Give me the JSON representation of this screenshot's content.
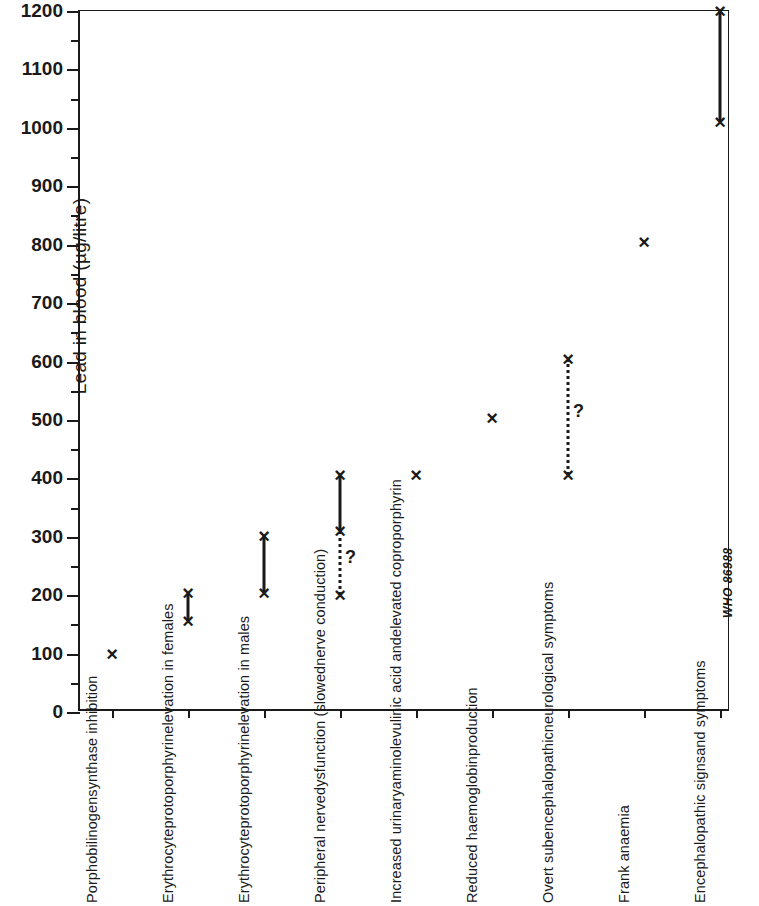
{
  "chart_data": {
    "type": "scatter",
    "title": "",
    "xlabel": "",
    "ylabel": "Lead in blood (µg/litre)",
    "ylim": [
      0,
      1200
    ],
    "ytick_labels": [
      "0",
      "100",
      "200",
      "300",
      "400",
      "500",
      "600",
      "700",
      "800",
      "900",
      "1000",
      "1100",
      "1200"
    ],
    "ytick_values": [
      0,
      100,
      200,
      300,
      400,
      500,
      600,
      700,
      800,
      900,
      1000,
      1100,
      1200
    ],
    "yminor_step": 50,
    "grid": false,
    "legend": null,
    "categories": [
      "Porphobilinogen synthase inhibition",
      "Erythrocyte protoporphyrin elevation in females",
      "Erythrocyte protoporphyrin elevation in males",
      "Peripheral nerve dysfunction (slowed nerve conduction)",
      "Increased urinary aminolevulinic acid and elevated coproporphyrin",
      "Reduced haemoglobin production",
      "Overt subencephalopathic neurological symptoms",
      "Frank anaemia",
      "Encephalopathic signs and symptoms"
    ],
    "category_label_lines": [
      [
        "Porphobilinogen",
        "synthase inhibition"
      ],
      [
        "Erythrocyte",
        "protoporphyrin",
        "elevation in females"
      ],
      [
        "Erythrocyte",
        "protoporphyrin",
        "elevation in males"
      ],
      [
        "Peripheral nerve",
        "dysfunction (slowed",
        "nerve conduction)"
      ],
      [
        "Increased urinary",
        "aminolevulinic acid and",
        "elevated coproporphyrin"
      ],
      [
        "Reduced haemoglobin",
        "production"
      ],
      [
        "Overt subencephalopathic",
        "neurological symptoms"
      ],
      [
        "Frank anaemia"
      ],
      [
        "Encephalopathic signs",
        "and symptoms"
      ]
    ],
    "points": [
      {
        "category": "Porphobilinogen synthase inhibition",
        "marks": [
          100
        ],
        "segments": []
      },
      {
        "category": "Erythrocyte protoporphyrin elevation in females",
        "marks": [
          155,
          203
        ],
        "segments": [
          {
            "from": 155,
            "to": 203,
            "style": "solid",
            "label": ""
          }
        ]
      },
      {
        "category": "Erythrocyte protoporphyrin elevation in males",
        "marks": [
          203,
          302
        ],
        "segments": [
          {
            "from": 203,
            "to": 302,
            "style": "solid",
            "label": ""
          }
        ]
      },
      {
        "category": "Peripheral nerve dysfunction (slowed nerve conduction)",
        "marks": [
          200,
          310,
          405
        ],
        "segments": [
          {
            "from": 310,
            "to": 405,
            "style": "solid",
            "label": ""
          },
          {
            "from": 200,
            "to": 310,
            "style": "dotted",
            "label": "?"
          }
        ]
      },
      {
        "category": "Increased urinary aminolevulinic acid and elevated coproporphyrin",
        "marks": [
          406
        ],
        "segments": []
      },
      {
        "category": "Reduced haemoglobin production",
        "marks": [
          503
        ],
        "segments": []
      },
      {
        "category": "Overt subencephalopathic neurological symptoms",
        "marks": [
          406,
          605
        ],
        "segments": [
          {
            "from": 406,
            "to": 605,
            "style": "dotted",
            "label": "?"
          }
        ]
      },
      {
        "category": "Frank anaemia",
        "marks": [
          805
        ],
        "segments": []
      },
      {
        "category": "Encephalopathic signs and symptoms",
        "marks": [
          1010,
          1200
        ],
        "segments": [
          {
            "from": 1010,
            "to": 1200,
            "style": "solid",
            "label": ""
          }
        ]
      }
    ],
    "marker_glyph": "×",
    "marker_color": "#1a1a1a",
    "axis_color": "#1a1a1a",
    "background_color": "#ffffff"
  },
  "watermark": {
    "text": "WHO 86988"
  }
}
